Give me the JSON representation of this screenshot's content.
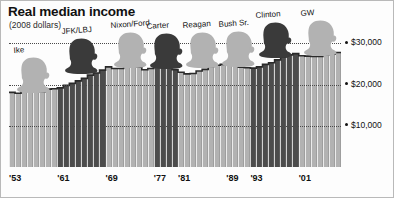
{
  "header": {
    "title": "Real median income",
    "subtitle": "(2008 dollars)"
  },
  "colors": {
    "republican": "#b2b2b2",
    "democrat": "#4c4c4c",
    "gridline": "#4a4a4a",
    "text": "#111111",
    "background": "#ffffff"
  },
  "chart_data": {
    "type": "bar",
    "title": "Real median income",
    "subtitle": "(2008 dollars)",
    "xlabel": "",
    "ylabel": "",
    "ylim": [
      0,
      33000
    ],
    "grid": true,
    "legend_position": "none",
    "ytick_labels": [
      "$30,000",
      "$20,000",
      "$10,000"
    ],
    "ytick_values": [
      30000,
      20000,
      10000
    ],
    "xtick_labels": [
      "'53",
      "'61",
      "'69",
      "'77",
      "'81",
      "'89",
      "'93",
      "'01"
    ],
    "xtick_years": [
      1953,
      1961,
      1969,
      1977,
      1981,
      1989,
      1993,
      2001
    ],
    "years": [
      1953,
      1954,
      1955,
      1956,
      1957,
      1958,
      1959,
      1960,
      1961,
      1962,
      1963,
      1964,
      1965,
      1966,
      1967,
      1968,
      1969,
      1970,
      1971,
      1972,
      1973,
      1974,
      1975,
      1976,
      1977,
      1978,
      1979,
      1980,
      1981,
      1982,
      1983,
      1984,
      1985,
      1986,
      1987,
      1988,
      1989,
      1990,
      1991,
      1992,
      1993,
      1994,
      1995,
      1996,
      1997,
      1998,
      1999,
      2000,
      2001,
      2002,
      2003,
      2004,
      2005,
      2006,
      2007
    ],
    "values": [
      18100,
      17900,
      18600,
      18500,
      18400,
      18300,
      18900,
      19000,
      19200,
      19800,
      20300,
      20900,
      21500,
      22300,
      22800,
      23500,
      24300,
      23900,
      23900,
      24500,
      24900,
      24200,
      23600,
      23900,
      24200,
      24700,
      24600,
      23600,
      23000,
      22600,
      22700,
      23300,
      23700,
      24400,
      24700,
      24900,
      25300,
      24700,
      24200,
      24100,
      24000,
      24300,
      24900,
      25300,
      26000,
      26700,
      27200,
      27500,
      27000,
      26900,
      26800,
      26800,
      27200,
      27400,
      27800
    ],
    "series_note": "Real median household income in 2008 dollars, 1953-2007",
    "party_by_year": [
      "R",
      "R",
      "R",
      "R",
      "R",
      "R",
      "R",
      "R",
      "D",
      "D",
      "D",
      "D",
      "D",
      "D",
      "D",
      "D",
      "R",
      "R",
      "R",
      "R",
      "R",
      "R",
      "R",
      "R",
      "D",
      "D",
      "D",
      "D",
      "R",
      "R",
      "R",
      "R",
      "R",
      "R",
      "R",
      "R",
      "R",
      "R",
      "R",
      "R",
      "D",
      "D",
      "D",
      "D",
      "D",
      "D",
      "D",
      "D",
      "R",
      "R",
      "R",
      "R",
      "R",
      "R",
      "R"
    ]
  },
  "presidents": [
    {
      "name": "Ike",
      "party": "R",
      "shade": "light"
    },
    {
      "name": "JFK/LBJ",
      "party": "D",
      "shade": "dark"
    },
    {
      "name": "Nixon/Ford",
      "party": "R",
      "shade": "light"
    },
    {
      "name": "Carter",
      "party": "D",
      "shade": "dark"
    },
    {
      "name": "Reagan",
      "party": "R",
      "shade": "light"
    },
    {
      "name": "Bush Sr.",
      "party": "R",
      "shade": "light"
    },
    {
      "name": "Clinton",
      "party": "D",
      "shade": "dark"
    },
    {
      "name": "GW",
      "party": "R",
      "shade": "light"
    }
  ]
}
